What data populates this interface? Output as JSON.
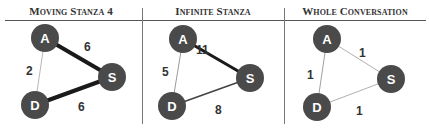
{
  "panels": [
    {
      "title": "Moving Stanza 4",
      "nodes": [
        {
          "id": "A",
          "x": 45,
          "y": 38
        },
        {
          "id": "S",
          "x": 112,
          "y": 77
        },
        {
          "id": "D",
          "x": 35,
          "y": 105
        }
      ],
      "edges": [
        {
          "from": "A",
          "to": "S",
          "weight": "6",
          "lx": 84,
          "ly": 51,
          "width": 4,
          "color": "#1a1a1a"
        },
        {
          "from": "A",
          "to": "D",
          "weight": "2",
          "lx": 26,
          "ly": 75,
          "width": 1,
          "color": "#b8b8b8"
        },
        {
          "from": "D",
          "to": "S",
          "weight": "6",
          "lx": 78,
          "ly": 111,
          "width": 4,
          "color": "#1a1a1a"
        }
      ]
    },
    {
      "title": "Infinite Stanza",
      "nodes": [
        {
          "id": "A",
          "x": 183,
          "y": 39
        },
        {
          "id": "S",
          "x": 250,
          "y": 78
        },
        {
          "id": "D",
          "x": 172,
          "y": 106
        }
      ],
      "edges": [
        {
          "from": "A",
          "to": "S",
          "weight": "11",
          "lx": 196,
          "ly": 54,
          "width": 3,
          "color": "#1a1a1a"
        },
        {
          "from": "A",
          "to": "D",
          "weight": "5",
          "lx": 162,
          "ly": 76,
          "width": 1,
          "color": "#9a9a9a"
        },
        {
          "from": "D",
          "to": "S",
          "weight": "8",
          "lx": 215,
          "ly": 114,
          "width": 1.6,
          "color": "#444444"
        }
      ]
    },
    {
      "title": "Whole Conversation",
      "nodes": [
        {
          "id": "A",
          "x": 327,
          "y": 39
        },
        {
          "id": "S",
          "x": 391,
          "y": 79
        },
        {
          "id": "D",
          "x": 317,
          "y": 107
        }
      ],
      "edges": [
        {
          "from": "A",
          "to": "S",
          "weight": "1",
          "lx": 359,
          "ly": 57,
          "width": 1,
          "color": "#b0b0b0"
        },
        {
          "from": "A",
          "to": "D",
          "weight": "1",
          "lx": 307,
          "ly": 79,
          "width": 1,
          "color": "#a0a0a0"
        },
        {
          "from": "D",
          "to": "S",
          "weight": "1",
          "lx": 356,
          "ly": 115,
          "width": 1,
          "color": "#b0b0b0"
        }
      ]
    }
  ],
  "style": {
    "node_color": "#4a4a4a",
    "node_radius": 14
  }
}
